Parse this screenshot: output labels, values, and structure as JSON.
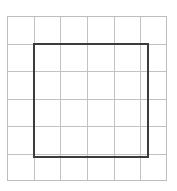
{
  "figure": {
    "canvas": {
      "width": 177,
      "height": 191,
      "background_color": "#ffffff"
    },
    "grid": {
      "name": "background-grid",
      "columns": 6,
      "rows": 6,
      "line_color": "#c2c2c2",
      "border_color": "#bdbdbd",
      "line_width": 1,
      "cell_fill": "#ffffff",
      "origin_x": 7,
      "origin_y": 16,
      "width": 160,
      "height": 165,
      "cell_width": 26.6667,
      "cell_height": 27.5
    },
    "shape": {
      "name": "dark-square",
      "type": "square",
      "stroke_color": "#3c3c3c",
      "fill": "none",
      "stroke_width": 2,
      "start_column": 1,
      "end_column": 5,
      "start_row": 1,
      "end_row": 5,
      "cells_wide": 4,
      "cells_tall": 4,
      "x": 34,
      "y": 44,
      "width": 114,
      "height": 113
    }
  }
}
